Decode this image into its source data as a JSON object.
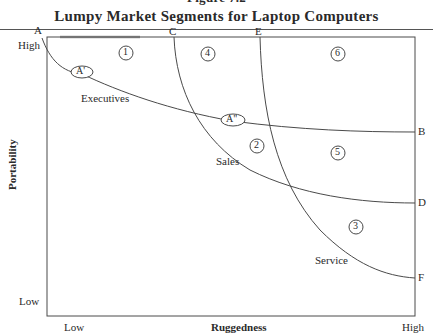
{
  "figure": {
    "number": "Figure 7.2",
    "title": "Lumpy Market Segments for Laptop Computers"
  },
  "axes": {
    "x_label": "Ruggedness",
    "x_low": "Low",
    "x_high": "High",
    "y_label": "Portability",
    "y_low": "Low",
    "y_high": "High"
  },
  "curve_endpoints": {
    "A": "A",
    "B": "B",
    "C": "C",
    "D": "D",
    "E": "E",
    "F": "F"
  },
  "points": {
    "a_prime": "A'",
    "a_double_prime": "A\""
  },
  "segments": {
    "executives": "Executives",
    "sales": "Sales",
    "service": "Service"
  },
  "regions": [
    "1",
    "2",
    "3",
    "4",
    "5",
    "6"
  ],
  "colors": {
    "line": "#4a4a4a",
    "text": "#2a2a2a"
  }
}
